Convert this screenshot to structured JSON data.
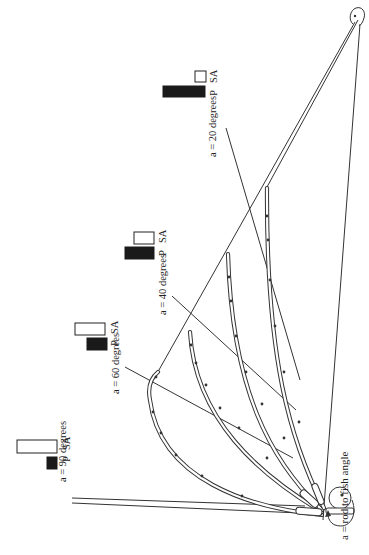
{
  "diagram": {
    "angle_definition_label": "a = rod to fish angle",
    "bar_legend": {
      "p": "P",
      "sa": "SA"
    },
    "colors": {
      "ink": "#333333",
      "p_bar": "#1a1a1a",
      "sa_bar": "#ffffff",
      "background": "#ffffff"
    },
    "cases": [
      {
        "id": "a90",
        "label": "a = 90 degrees",
        "angle": 90,
        "p_bar_relative": 0.28,
        "sa_bar_relative": 0.62
      },
      {
        "id": "a60",
        "label": "a = 60 degrees",
        "angle": 60,
        "p_bar_relative": 0.45,
        "sa_bar_relative": 0.55
      },
      {
        "id": "a40",
        "label": "a = 40 degrees",
        "angle": 40,
        "p_bar_relative": 0.62,
        "sa_bar_relative": 0.35
      },
      {
        "id": "a20",
        "label": "a = 20 degrees",
        "angle": 20,
        "p_bar_relative": 0.88,
        "sa_bar_relative": 0.18
      }
    ],
    "elements": {
      "angler_hand": "circle at rod butt",
      "fish": "small fish head at upper right"
    }
  }
}
